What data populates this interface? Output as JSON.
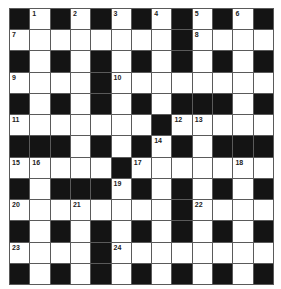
{
  "puzzle": {
    "rows": 13,
    "cols": 13,
    "colors": {
      "black": "#141414",
      "white": "#ffffff",
      "grid_line": "#5a5a5a",
      "number": "#222222"
    },
    "layout": [
      "#.#.#.#.#.#.#",
      "........#....",
      "#.#.#.#.#.#.#",
      "....#........",
      "#.#.#.#.###.#",
      ".......#.....",
      "###.#.#.#.###",
      ".....#.......",
      "#.###.#.#.#.#",
      "........#....",
      "#.#.#.#.#.#.#",
      "....#........",
      "#.#.#.#.#.#.#"
    ],
    "numbers": [
      {
        "r": 0,
        "c": 1,
        "n": "1"
      },
      {
        "r": 0,
        "c": 3,
        "n": "2"
      },
      {
        "r": 0,
        "c": 5,
        "n": "3"
      },
      {
        "r": 0,
        "c": 7,
        "n": "4"
      },
      {
        "r": 0,
        "c": 9,
        "n": "5"
      },
      {
        "r": 0,
        "c": 11,
        "n": "6"
      },
      {
        "r": 1,
        "c": 0,
        "n": "7"
      },
      {
        "r": 1,
        "c": 9,
        "n": "8"
      },
      {
        "r": 3,
        "c": 0,
        "n": "9"
      },
      {
        "r": 3,
        "c": 5,
        "n": "10"
      },
      {
        "r": 5,
        "c": 0,
        "n": "11"
      },
      {
        "r": 5,
        "c": 8,
        "n": "12"
      },
      {
        "r": 5,
        "c": 9,
        "n": "13"
      },
      {
        "r": 6,
        "c": 7,
        "n": "14"
      },
      {
        "r": 7,
        "c": 0,
        "n": "15"
      },
      {
        "r": 7,
        "c": 1,
        "n": "16"
      },
      {
        "r": 7,
        "c": 6,
        "n": "17"
      },
      {
        "r": 7,
        "c": 11,
        "n": "18"
      },
      {
        "r": 8,
        "c": 5,
        "n": "19"
      },
      {
        "r": 9,
        "c": 0,
        "n": "20"
      },
      {
        "r": 9,
        "c": 3,
        "n": "21"
      },
      {
        "r": 9,
        "c": 9,
        "n": "22"
      },
      {
        "r": 11,
        "c": 0,
        "n": "23"
      },
      {
        "r": 11,
        "c": 5,
        "n": "24"
      }
    ]
  }
}
